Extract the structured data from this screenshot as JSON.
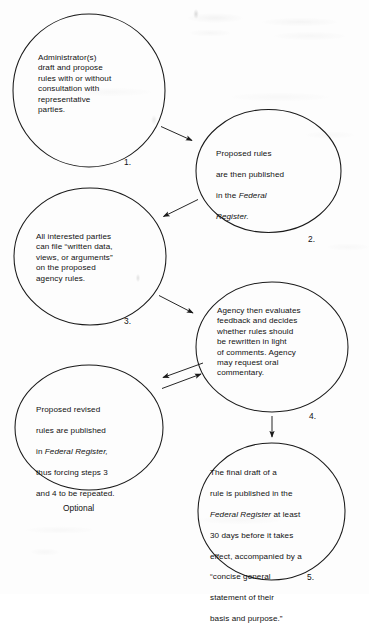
{
  "diagram": {
    "stroke_color": "#1a1a1a",
    "background_color": "#fdfdfd",
    "text_color": "#111111",
    "nodes": [
      {
        "id": "node-1",
        "number": "1.",
        "text": "Administrator(s)\ndraft and propose\nrules with or without\nconsultation with\nrepresentative\nparties.",
        "caption": ""
      },
      {
        "id": "node-2",
        "number": "2.",
        "text_line_1": "Proposed rules",
        "text_line_2": "are then published",
        "text_line_3_pre": "in the ",
        "text_line_3_italic": "Federal",
        "text_line_4_italic": "Register.",
        "caption": ""
      },
      {
        "id": "node-3",
        "number": "3.",
        "text": "All interested parties\ncan file “written data,\nviews, or arguments”\non the proposed\nagency rules.",
        "caption": ""
      },
      {
        "id": "node-4",
        "number": "4.",
        "text": "Agency then evaluates\nfeedback and decides\nwhether rules should\nbe rewritten in light\nof comments. Agency\nmay request oral\ncommentary.",
        "caption": ""
      },
      {
        "id": "node-optional",
        "number": "",
        "text_line_1": "Proposed revised",
        "text_line_2": "rules are published",
        "text_line_3_pre": "in ",
        "text_line_3_italic": "Federal Register,",
        "text_line_4": "thus forcing steps 3",
        "text_line_5": "and 4 to be repeated.",
        "caption": "Optional"
      },
      {
        "id": "node-5",
        "number": "5.",
        "text_line_1": "The final draft of a",
        "text_line_2": "rule is published in the",
        "text_line_3_italic": "Federal Register",
        "text_line_3_post": " at least",
        "text_line_4": "30 days before it takes",
        "text_line_5": "effect, accompanied by a",
        "text_line_6": "“concise general",
        "text_line_7": "statement of their",
        "text_line_8": "basis and purpose.”",
        "caption": ""
      }
    ],
    "connectors": [
      {
        "id": "arrow-1-to-2",
        "from": "node-1",
        "to": "node-2",
        "direction": "down-right"
      },
      {
        "id": "arrow-2-to-3",
        "from": "node-2",
        "to": "node-3",
        "direction": "down-left"
      },
      {
        "id": "arrow-3-to-4",
        "from": "node-3",
        "to": "node-4",
        "direction": "down-right"
      },
      {
        "id": "arrow-4-to-optional",
        "from": "node-4",
        "to": "node-optional",
        "direction": "left"
      },
      {
        "id": "arrow-optional-to-4",
        "from": "node-optional",
        "to": "node-4",
        "direction": "right"
      },
      {
        "id": "arrow-4-to-5",
        "from": "node-4",
        "to": "node-5",
        "direction": "down"
      }
    ]
  }
}
